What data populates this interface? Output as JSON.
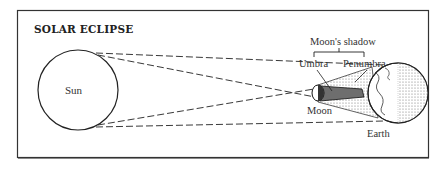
{
  "diagram": {
    "title": "SOLAR ECLIPSE",
    "labels": {
      "sun": "Sun",
      "moon": "Moon",
      "earth": "Earth",
      "moons_shadow": "Moon's shadow",
      "umbra": "Umbra",
      "penumbra": "Penumbra"
    },
    "colors": {
      "line": "#222222",
      "frame": "#333333",
      "umbra_fill": "#444444",
      "penumbra_fill": "#aaaaaa",
      "earth_night_fill": "#cccccc"
    }
  }
}
